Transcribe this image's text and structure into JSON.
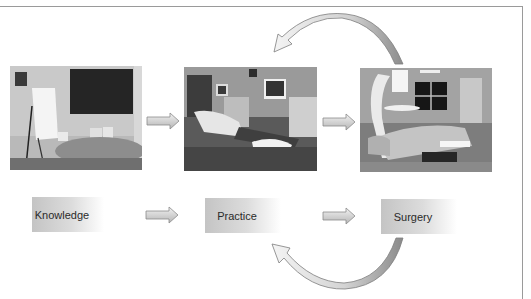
{
  "diagram": {
    "stages": [
      {
        "id": "knowledge",
        "label": "Knowledge",
        "photo": "conference-room-photo"
      },
      {
        "id": "practice",
        "label": "Practice",
        "photo": "simulation-lab-photo"
      },
      {
        "id": "surgery",
        "label": "Surgery",
        "photo": "operating-room-photo"
      }
    ],
    "arrows": [
      {
        "from": "knowledge",
        "to": "practice",
        "type": "straight"
      },
      {
        "from": "practice",
        "to": "surgery",
        "type": "straight"
      },
      {
        "from": "surgery",
        "to": "practice",
        "type": "curved-feedback-top"
      },
      {
        "from": "surgery",
        "to": "practice",
        "type": "curved-feedback-bottom"
      }
    ],
    "colors": {
      "label_gradient_start": "#c4c4c4",
      "label_gradient_end": "#ffffff",
      "arrow_fill": "#d8d8d8",
      "arrow_stroke": "#8a8a8a",
      "frame": "#9a9a9a"
    }
  }
}
